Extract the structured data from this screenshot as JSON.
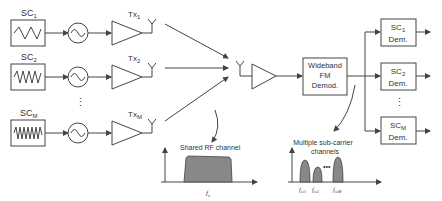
{
  "colors": {
    "line": "#444444",
    "text": "#333333",
    "spectrum_fill": "#888888",
    "background": "#ffffff"
  },
  "transmitters": [
    {
      "source_label": "SC",
      "source_sub": "1",
      "tx_label": "Tx",
      "tx_sub": "1"
    },
    {
      "source_label": "SC",
      "source_sub": "2",
      "tx_label": "Tx",
      "tx_sub": "2"
    },
    {
      "source_label": "SC",
      "source_sub": "M",
      "tx_label": "Tx",
      "tx_sub": "M"
    }
  ],
  "ellipsis": "⋮",
  "receiver": {
    "demod_lines": [
      "Wideband",
      "FM",
      "Demod."
    ]
  },
  "demodulators": [
    {
      "label": "SC",
      "sub": "1",
      "line2": "Dem."
    },
    {
      "label": "SC",
      "sub": "2",
      "line2": "Dem."
    },
    {
      "label": "SC",
      "sub": "M",
      "line2": "Dem."
    }
  ],
  "spectrum_rf": {
    "title": "Shared RF channel",
    "center_label": "f",
    "center_sub": "c"
  },
  "spectrum_sub": {
    "title_line1": "Multiple sub-carrier",
    "title_line2": "channels",
    "dots": "•••",
    "labels": [
      {
        "f": "f",
        "sub": "sc1"
      },
      {
        "f": "f",
        "sub": "sc2"
      },
      {
        "f": "f",
        "sub": "scM"
      }
    ]
  }
}
